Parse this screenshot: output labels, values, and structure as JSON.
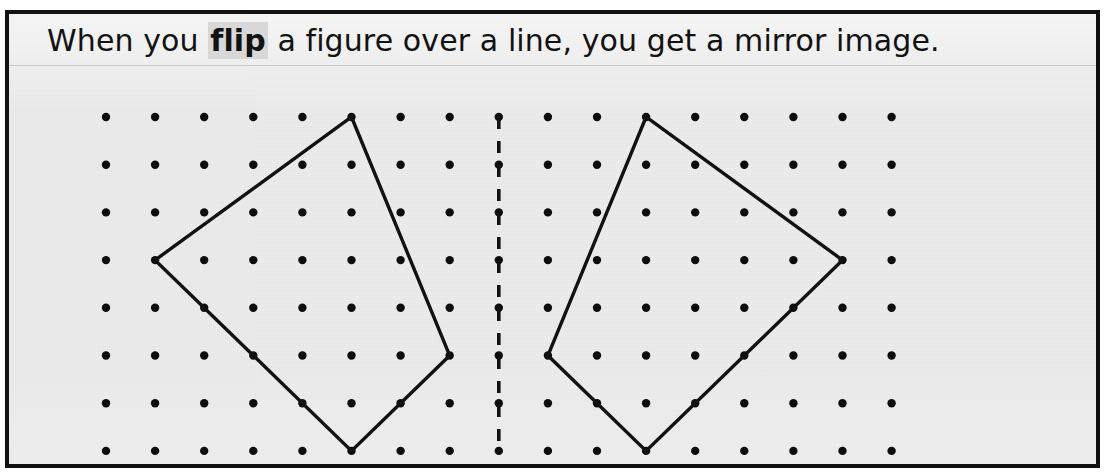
{
  "page": {
    "title": "When you flip a figure over a line, you get a mirror image.",
    "background_color": "#ececec",
    "border_color": "#111111",
    "ink_color": "#121212"
  },
  "caption": {
    "before": "When you ",
    "keyword": "flip",
    "after": " a figure over a line, you get a mirror image.",
    "keyword_highlight_color": "#d8d8d8"
  },
  "chart_data": {
    "type": "scatter",
    "title": "When you flip a figure over a line, you get a mirror image.",
    "xlabel": "",
    "ylabel": "",
    "grid": true,
    "legend_position": "none",
    "geoboard": {
      "columns": 17,
      "rows": 8,
      "origin_x": 101,
      "origin_y": 51,
      "step_x": 49.1,
      "step_y": 47.7,
      "dot_radius": 4.2,
      "dot_color": "#0d0d0d"
    },
    "xlim": [
      0,
      16
    ],
    "ylim": [
      0,
      7
    ],
    "mirror_line": {
      "label": "line of reflection",
      "orientation": "vertical",
      "column": 8,
      "row_start": 0,
      "row_end": 7,
      "style": "dashed",
      "color": "#121212"
    },
    "series": [
      {
        "name": "original-figure",
        "shape": "quadrilateral",
        "closed": true,
        "vertices": [
          {
            "col": 5,
            "row": 0
          },
          {
            "col": 7,
            "row": 5
          },
          {
            "col": 5,
            "row": 7
          },
          {
            "col": 1,
            "row": 3
          }
        ]
      },
      {
        "name": "mirror-image-figure",
        "shape": "quadrilateral",
        "closed": true,
        "vertices": [
          {
            "col": 11,
            "row": 0
          },
          {
            "col": 9,
            "row": 5
          },
          {
            "col": 11,
            "row": 7
          },
          {
            "col": 15,
            "row": 3
          }
        ]
      }
    ]
  }
}
